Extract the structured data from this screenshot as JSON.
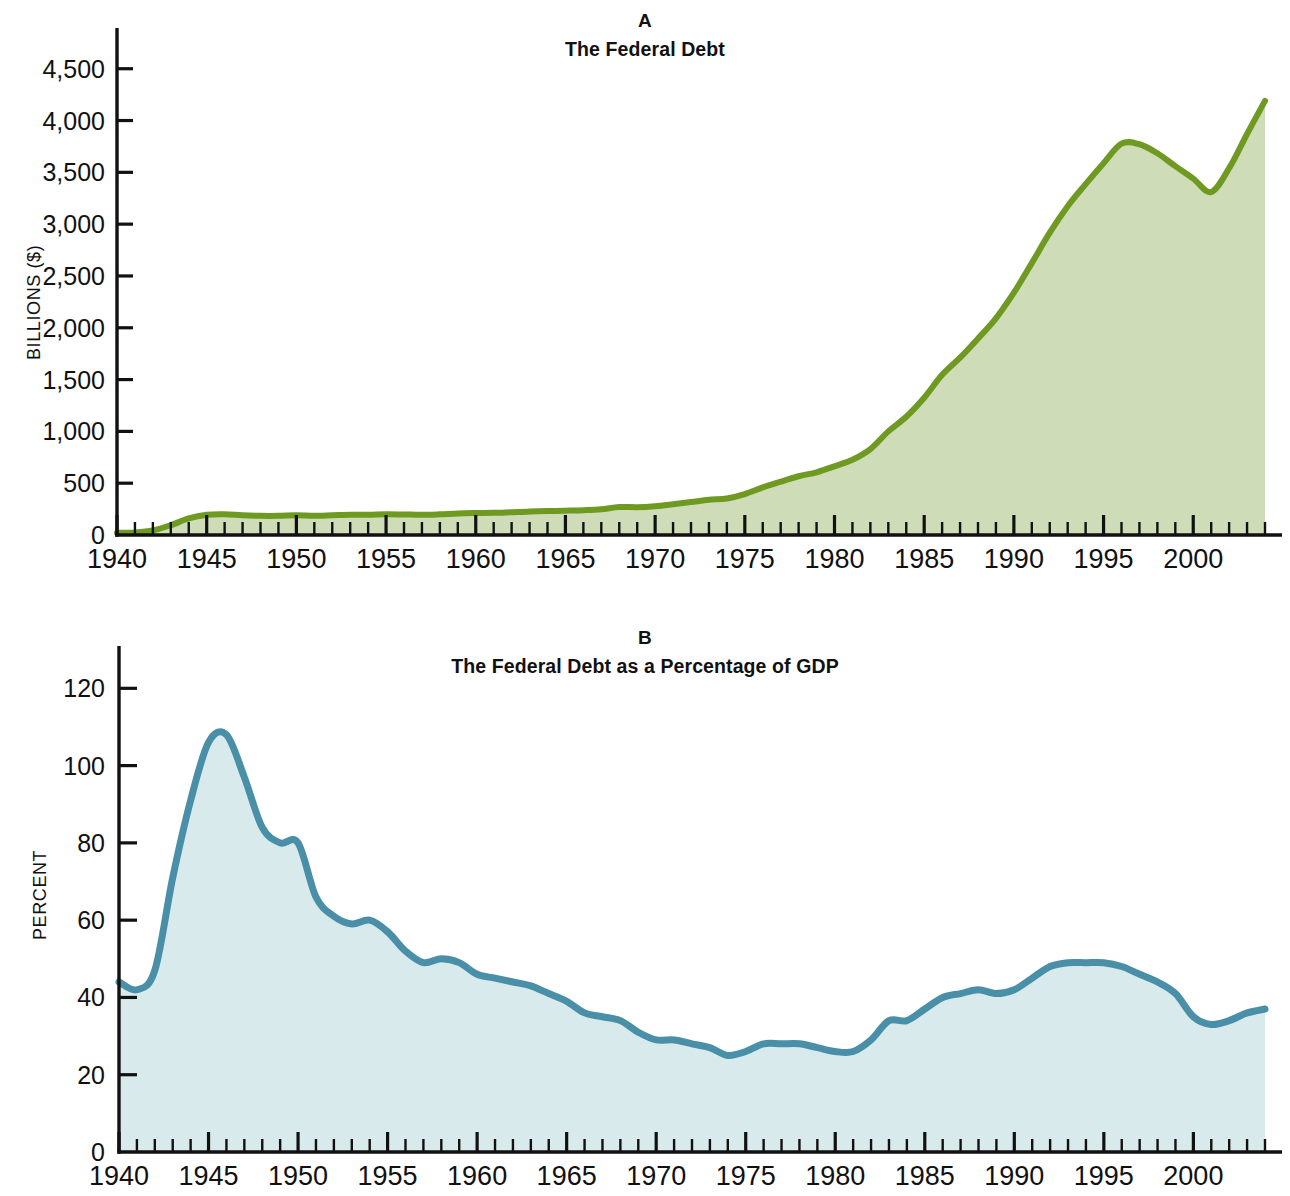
{
  "figure": {
    "background": "#ffffff"
  },
  "panel_a": {
    "letter": "A",
    "title": "The Federal Debt",
    "ylabel": "BILLIONS ($)",
    "yticks": [
      "0",
      "500",
      "1,000",
      "1,500",
      "2,000",
      "2,500",
      "3,000",
      "3,500",
      "4,000",
      "4,500"
    ],
    "xticks": [
      "1940",
      "1945",
      "1950",
      "1955",
      "1960",
      "1965",
      "1970",
      "1975",
      "1980",
      "1985",
      "1990",
      "1995",
      "2000"
    ],
    "line_color": "#6e9a21",
    "fill_color": "#cfdcb8"
  },
  "panel_b": {
    "letter": "B",
    "title": "The Federal Debt as a Percentage of GDP",
    "ylabel": "PERCENT",
    "yticks": [
      "0",
      "20",
      "40",
      "60",
      "80",
      "100",
      "120"
    ],
    "xticks": [
      "1940",
      "1945",
      "1950",
      "1955",
      "1960",
      "1965",
      "1970",
      "1975",
      "1980",
      "1985",
      "1990",
      "1995",
      "2000"
    ],
    "line_color": "#4a8fa8",
    "fill_color": "#d9eaec"
  },
  "chart_data": [
    {
      "type": "area",
      "id": "panel-a",
      "title": "The Federal Debt",
      "panel_letter": "A",
      "xlabel": "",
      "ylabel": "BILLIONS ($)",
      "xlim": [
        1940,
        2004
      ],
      "ylim": [
        0,
        4700
      ],
      "ytick_values": [
        0,
        500,
        1000,
        1500,
        2000,
        2500,
        3000,
        3500,
        4000,
        4500
      ],
      "xtick_values": [
        1940,
        1945,
        1950,
        1955,
        1960,
        1965,
        1970,
        1975,
        1980,
        1985,
        1990,
        1995,
        2000
      ],
      "xtick_minor_step": 1,
      "grid": false,
      "legend": "none",
      "line_color": "#6e9a21",
      "fill_color": "#cfdcb8",
      "x": [
        1940,
        1941,
        1942,
        1943,
        1944,
        1945,
        1946,
        1947,
        1948,
        1949,
        1950,
        1951,
        1952,
        1953,
        1954,
        1955,
        1956,
        1957,
        1958,
        1959,
        1960,
        1961,
        1962,
        1963,
        1964,
        1965,
        1966,
        1967,
        1968,
        1969,
        1970,
        1971,
        1972,
        1973,
        1974,
        1975,
        1976,
        1977,
        1978,
        1979,
        1980,
        1981,
        1982,
        1983,
        1984,
        1985,
        1986,
        1987,
        1988,
        1989,
        1990,
        1991,
        1992,
        1993,
        1994,
        1995,
        1996,
        1997,
        1998,
        1999,
        2000,
        2001,
        2002,
        2003,
        2004
      ],
      "values": [
        43,
        49,
        72,
        137,
        201,
        259,
        271,
        257,
        252,
        253,
        257,
        255,
        259,
        266,
        271,
        274,
        273,
        271,
        276,
        285,
        291,
        293,
        303,
        311,
        317,
        323,
        329,
        341,
        370,
        367,
        381,
        408,
        436,
        466,
        484,
        542,
        629,
        706,
        777,
        829,
        909,
        995,
        1137,
        1372,
        1565,
        1817,
        2120,
        2346,
        2601,
        2868,
        3206,
        3598,
        4001,
        4351,
        4643,
        4921,
        5181,
        5369,
        5478,
        5606,
        5629,
        5770,
        6198,
        6760,
        7379
      ],
      "values_note": "Chart as drawn tops out near 4,200 at the right edge; series shown is the gross federal debt in billions of dollars",
      "drawn_values": [
        20,
        25,
        45,
        95,
        160,
        195,
        200,
        190,
        185,
        185,
        190,
        185,
        190,
        195,
        195,
        200,
        198,
        195,
        200,
        208,
        212,
        214,
        220,
        226,
        231,
        235,
        240,
        249,
        270,
        268,
        278,
        297,
        318,
        340,
        353,
        395,
        459,
        515,
        567,
        605,
        663,
        726,
        829,
        1000,
        1141,
        1325,
        1546,
        1711,
        1896,
        2091,
        2338,
        2624,
        2918,
        3173,
        3386,
        3588,
        3777,
        3771,
        3684,
        3560,
        3440,
        3310,
        3540,
        3870,
        4190
      ]
    },
    {
      "type": "area",
      "id": "panel-b",
      "title": "The Federal Debt as a Percentage of GDP",
      "panel_letter": "B",
      "xlabel": "",
      "ylabel": "PERCENT",
      "xlim": [
        1940,
        2004
      ],
      "ylim": [
        0,
        125
      ],
      "ytick_values": [
        0,
        20,
        40,
        60,
        80,
        100,
        120
      ],
      "xtick_values": [
        1940,
        1945,
        1950,
        1955,
        1960,
        1965,
        1970,
        1975,
        1980,
        1985,
        1990,
        1995,
        2000
      ],
      "xtick_minor_step": 1,
      "grid": false,
      "legend": "none",
      "line_color": "#4a8fa8",
      "fill_color": "#d9eaec",
      "x": [
        1940,
        1941,
        1942,
        1943,
        1944,
        1945,
        1946,
        1947,
        1948,
        1949,
        1950,
        1951,
        1952,
        1953,
        1954,
        1955,
        1956,
        1957,
        1958,
        1959,
        1960,
        1961,
        1962,
        1963,
        1964,
        1965,
        1966,
        1967,
        1968,
        1969,
        1970,
        1971,
        1972,
        1973,
        1974,
        1975,
        1976,
        1977,
        1978,
        1979,
        1980,
        1981,
        1982,
        1983,
        1984,
        1985,
        1986,
        1987,
        1988,
        1989,
        1990,
        1991,
        1992,
        1993,
        1994,
        1995,
        1996,
        1997,
        1998,
        1999,
        2000,
        2001,
        2002,
        2003,
        2004
      ],
      "values": [
        44,
        42,
        47,
        71,
        91,
        106,
        108,
        97,
        84,
        80,
        80,
        66,
        61,
        59,
        60,
        57,
        52,
        49,
        50,
        49,
        46,
        45,
        44,
        43,
        41,
        39,
        36,
        35,
        34,
        31,
        29,
        29,
        28,
        27,
        25,
        26,
        28,
        28,
        28,
        27,
        26,
        26,
        29,
        34,
        34,
        37,
        40,
        41,
        42,
        41,
        42,
        45,
        48,
        49,
        49,
        49,
        48,
        46,
        44,
        41,
        35,
        33,
        34,
        36,
        37
      ],
      "values_note": "Percent of GDP; wartime peak near 108% in 1946, trough near 24% in 1974, secondary peak near 49% in 1993-95"
    }
  ]
}
